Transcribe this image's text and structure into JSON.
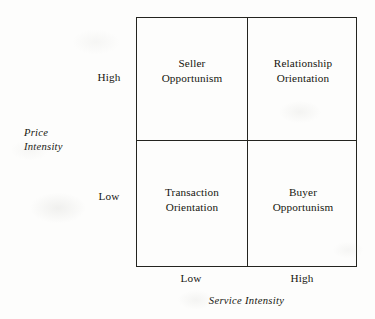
{
  "chart_data": {
    "type": "table",
    "title": "",
    "xlabel": "Service Intensity",
    "ylabel": "Price Intensity",
    "x_categories": [
      "Low",
      "High"
    ],
    "y_categories": [
      "High",
      "Low"
    ],
    "grid": true,
    "legend": "none",
    "cells": [
      {
        "row": "High",
        "column": "Low",
        "position": "top-left",
        "label": "Seller\nOpportunism"
      },
      {
        "row": "High",
        "column": "High",
        "position": "top-right",
        "label": "Relationship\nOrientation"
      },
      {
        "row": "Low",
        "column": "Low",
        "position": "bottom-left",
        "label": "Transaction\nOrientation"
      },
      {
        "row": "Low",
        "column": "High",
        "position": "bottom-right",
        "label": "Buyer\nOpportunism"
      }
    ]
  },
  "figure": {
    "quadrants": {
      "top_left": "Seller\nOpportunism",
      "top_right": "Relationship\nOrientation",
      "bottom_left": "Transaction\nOrientation",
      "bottom_right": "Buyer\nOpportunism"
    },
    "y_axis": {
      "title": "Price\nIntensity",
      "tick_high": "High",
      "tick_low": "Low"
    },
    "x_axis": {
      "title": "Service Intensity",
      "tick_low": "Low",
      "tick_high": "High"
    }
  },
  "colors": {
    "background": "#fdfdfc",
    "line": "#24241f",
    "text": "#16160f"
  }
}
